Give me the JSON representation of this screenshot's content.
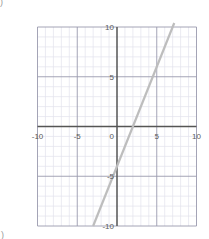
{
  "figure": {
    "corner_mark_top": ")",
    "corner_mark_bottom": ")",
    "background_color": "#ffffff"
  },
  "colors": {
    "minor_grid": "#e2e2ec",
    "major_grid": "#9a9aae",
    "axis": "#555555",
    "line": "#bdbdbd",
    "tick_text": "#5a5a5a"
  },
  "chart_data": {
    "type": "line",
    "title": "",
    "xlabel": "",
    "ylabel": "",
    "xlim": [
      -10,
      10
    ],
    "ylim": [
      -10,
      10
    ],
    "grid": true,
    "minor_grid_step": 1,
    "major_grid_step": 5,
    "legend": "none",
    "x_tick_labels": [
      "-10",
      "-5",
      "0",
      "5",
      "10"
    ],
    "x_tick_values": [
      -10,
      -5,
      0,
      5,
      10
    ],
    "y_tick_labels": [
      "10",
      "5",
      "-5",
      "-10"
    ],
    "y_tick_values": [
      10,
      5,
      -5,
      -10
    ],
    "series": [
      {
        "name": "y = 2x - 4",
        "slope": 2,
        "intercept": -4,
        "x": [
          -3,
          7.2
        ],
        "values": [
          -10,
          10.4
        ],
        "color": "#bdbdbd"
      }
    ]
  }
}
